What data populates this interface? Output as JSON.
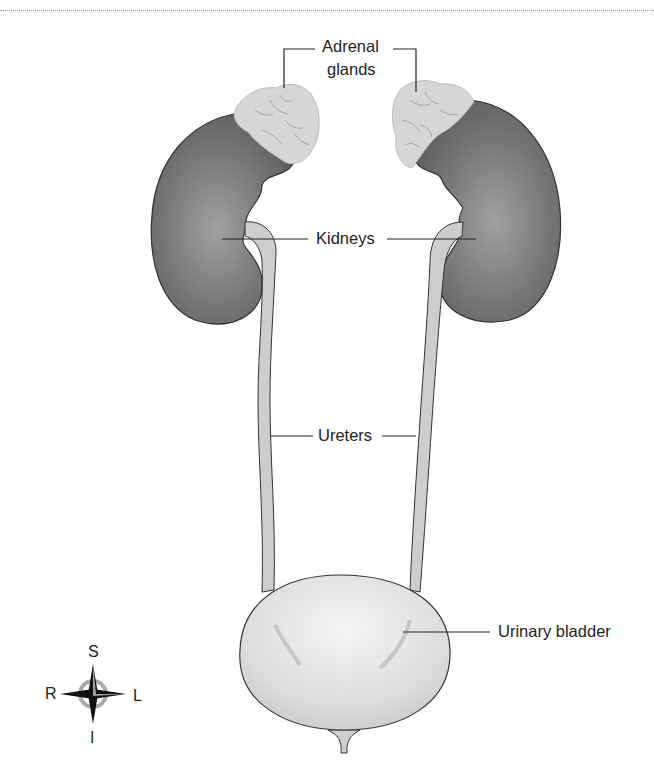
{
  "diagram": {
    "labels": {
      "adrenal_line1": "Adrenal",
      "adrenal_line2": "glands",
      "kidneys": "Kidneys",
      "ureters": "Ureters",
      "bladder": "Urinary bladder"
    },
    "compass": {
      "superior": "S",
      "inferior": "I",
      "right": "R",
      "left": "L"
    },
    "colors": {
      "kidney": "#6e6e6e",
      "kidney_highlight": "#9a9a9a",
      "adrenal": "#d9d9d9",
      "ureter": "#cfcfcf",
      "bladder": "#dedede",
      "outline": "#333333",
      "text": "#222222"
    }
  }
}
